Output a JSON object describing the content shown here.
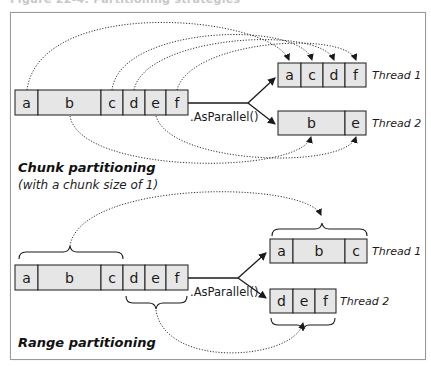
{
  "figure": {
    "top_caption_fragment": "Figure 22-4. Partitioning strategies",
    "colors": {
      "cell_fill": "#e6e6e6",
      "stroke": "#1a1a1a",
      "frame_border": "#9a9a9a",
      "background": "#ffffff"
    }
  },
  "chunk": {
    "title": "Chunk partitioning",
    "subtitle": "(with a chunk size of 1)",
    "operator": ".AsParallel()",
    "source": [
      "a",
      "b",
      "c",
      "d",
      "e",
      "f"
    ],
    "threads": [
      {
        "label": "Thread 1",
        "items": [
          "a",
          "c",
          "d",
          "f"
        ]
      },
      {
        "label": "Thread 2",
        "items": [
          "b",
          "e"
        ]
      }
    ]
  },
  "range": {
    "title": "Range partitioning",
    "operator": ".AsParallel()",
    "source": [
      "a",
      "b",
      "c",
      "d",
      "e",
      "f"
    ],
    "threads": [
      {
        "label": "Thread 1",
        "items": [
          "a",
          "b",
          "c"
        ]
      },
      {
        "label": "Thread 2",
        "items": [
          "d",
          "e",
          "f"
        ]
      }
    ]
  }
}
